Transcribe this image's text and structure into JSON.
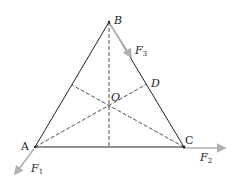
{
  "diagram": {
    "type": "equilateral triangle with medians and applied forces",
    "colors": {
      "line": "#222222",
      "force_arrow": "#b0b0b0",
      "background": "#ffffff"
    },
    "points": {
      "A": {
        "label": "A",
        "x": 35,
        "y": 147
      },
      "B": {
        "label": "B",
        "x": 109,
        "y": 22
      },
      "C": {
        "label": "C",
        "x": 184,
        "y": 147
      },
      "D": {
        "label": "D",
        "x": 147,
        "y": 84
      },
      "O": {
        "label": "O",
        "x": 109,
        "y": 106
      }
    },
    "forces": [
      {
        "name": "F",
        "sub": "1",
        "at": "A"
      },
      {
        "name": "F",
        "sub": "2",
        "at": "C"
      },
      {
        "name": "F",
        "sub": "3",
        "at": "B"
      }
    ]
  }
}
